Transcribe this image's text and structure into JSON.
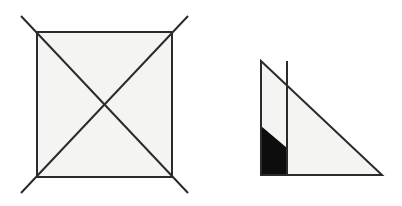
{
  "figure": {
    "background_color": "#ffffff",
    "stroke_color": "#2b2b2b",
    "fill_color": "#f4f4f2",
    "solid_fill_color": "#0d0d0d",
    "canvas": {
      "width": 402,
      "height": 206
    },
    "shapes": [
      {
        "name": "square-with-diagonals",
        "type": "square",
        "description": "Square with both diagonals drawn and extended past the corners",
        "stroke_width": 2,
        "square": {
          "x": 37,
          "y": 32,
          "width": 135,
          "height": 145
        },
        "corners": {
          "top_left": [
            37,
            32
          ],
          "top_right": [
            172,
            32
          ],
          "bottom_right": [
            172,
            177
          ],
          "bottom_left": [
            37,
            177
          ]
        },
        "diagonals": [
          {
            "name": "diagonal-tl-br",
            "from": [
              21,
              16
            ],
            "to": [
              188,
              193
            ]
          },
          {
            "name": "diagonal-tr-bl",
            "from": [
              188,
              16
            ],
            "to": [
              21,
              193
            ]
          }
        ],
        "overhang_px": 16
      },
      {
        "name": "right-triangle-with-partition",
        "type": "right-triangle",
        "description": "Right triangle with a vertical partition line and a shaded quadrilateral at the lower left",
        "stroke_width": 2,
        "vertices": {
          "apex_top": [
            261,
            61
          ],
          "right_angle_bottom_left": [
            261,
            175
          ],
          "bottom_right": [
            382,
            175
          ]
        },
        "inner_vertical_line": {
          "name": "partition-line",
          "x": 287,
          "from_y": 61,
          "to_y": 175
        },
        "shaded_region": {
          "name": "shaded-quadrilateral",
          "points": [
            [
              261,
              126
            ],
            [
              287,
              148
            ],
            [
              287,
              175
            ],
            [
              261,
              175
            ]
          ],
          "color": "#0d0d0d"
        }
      }
    ]
  }
}
